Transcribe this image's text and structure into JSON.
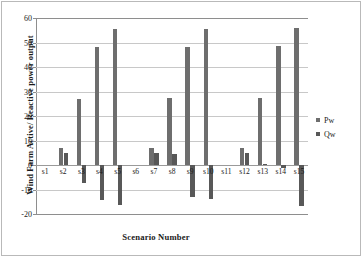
{
  "chart_data": {
    "type": "bar",
    "title": "",
    "xlabel": "Scenario Number",
    "ylabel": "Wind Farm Active/ Reactive power output",
    "categories": [
      "s1",
      "s2",
      "s3",
      "s4",
      "s5",
      "s6",
      "s7",
      "s8",
      "s9",
      "s10",
      "s11",
      "s12",
      "s13",
      "s14",
      "s15"
    ],
    "series": [
      {
        "name": "Pw",
        "color": "#6e6e6e",
        "values": [
          0,
          7,
          27,
          48.3,
          55.6,
          0,
          6.9,
          27.4,
          48.3,
          55.7,
          0,
          7,
          27.5,
          48.5,
          55.8
        ]
      },
      {
        "name": "Qw",
        "color": "#585858",
        "values": [
          0,
          5.1,
          -7.2,
          -14.4,
          -16.4,
          0,
          5.1,
          4.5,
          -13.2,
          -13.7,
          0,
          5.1,
          0.5,
          -1.2,
          -16.6
        ]
      }
    ],
    "ylim": [
      -20,
      60
    ],
    "yticks": [
      60,
      50,
      40,
      30,
      20,
      10,
      0,
      -10,
      -20
    ],
    "ytick_labels": [
      "60",
      "50",
      "40",
      "30",
      "20",
      "10",
      "0",
      "-10",
      "-20"
    ],
    "grid": true,
    "legend_position": "right",
    "legend_entries": [
      "Pw",
      "Qw"
    ]
  }
}
